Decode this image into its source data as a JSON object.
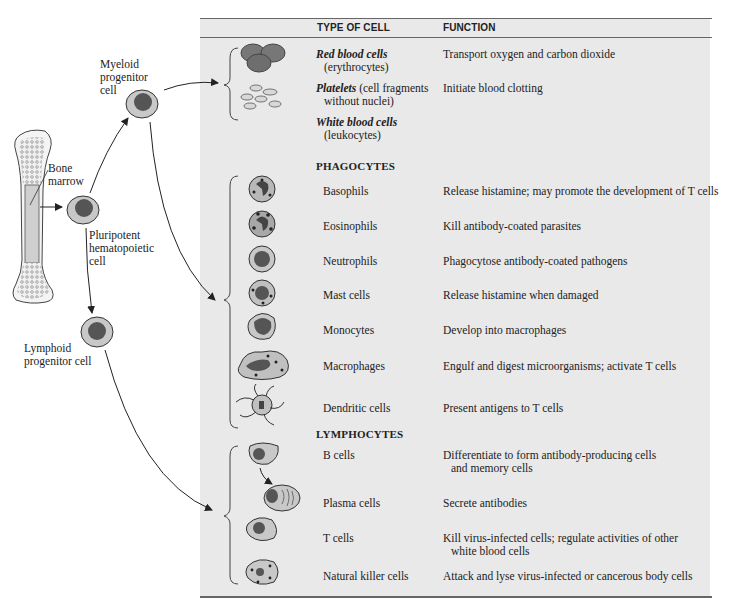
{
  "table": {
    "headers": {
      "type": "TYPE OF CELL",
      "function": "FUNCTION"
    },
    "top_rows": [
      {
        "name": "Red blood cells",
        "sub": "(erythrocytes)",
        "function": "Transport oxygen and carbon dioxide"
      },
      {
        "name": "Platelets",
        "name_rest": " (cell fragments",
        "sub": "without nuclei)",
        "function": "Initiate blood clotting"
      },
      {
        "name": "White blood cells",
        "sub": "(leukocytes)",
        "function": ""
      }
    ],
    "sections": {
      "phagocytes": "PHAGOCYTES",
      "lymphocytes": "LYMPHOCYTES"
    },
    "phagocytes": [
      {
        "name": "Basophils",
        "function": "Release histamine; may promote the development of T cells"
      },
      {
        "name": "Eosinophils",
        "function": "Kill antibody-coated parasites"
      },
      {
        "name": "Neutrophils",
        "function": "Phagocytose antibody-coated pathogens"
      },
      {
        "name": "Mast cells",
        "function": "Release histamine when damaged"
      },
      {
        "name": "Monocytes",
        "function": "Develop into macrophages"
      },
      {
        "name": "Macrophages",
        "function": "Engulf and digest microorganisms; activate T cells"
      },
      {
        "name": "Dendritic cells",
        "function": "Present antigens to T cells"
      }
    ],
    "lymphocytes": [
      {
        "name": "B cells",
        "function": "Differentiate to form antibody-producing cells",
        "function2": "and memory cells"
      },
      {
        "name": "Plasma cells",
        "function": "Secrete antibodies"
      },
      {
        "name": "T cells",
        "function": "Kill virus-infected cells; regulate activities of other",
        "function2": "white blood cells"
      },
      {
        "name": "Natural killer cells",
        "function": "Attack and lyse virus-infected or cancerous body cells"
      }
    ]
  },
  "labels": {
    "myeloid": [
      "Myeloid",
      "progenitor",
      "cell"
    ],
    "bone_marrow": [
      "Bone",
      "marrow"
    ],
    "pluripotent": [
      "Pluripotent",
      "hematopoietic",
      "cell"
    ],
    "lymphoid": [
      "Lymphoid",
      "progenitor cell"
    ]
  },
  "colors": {
    "panel_bg": "#e9e9e9",
    "cytoplasm": "#c8c8c8",
    "nucleus": "#555555",
    "rule": "#666666"
  }
}
